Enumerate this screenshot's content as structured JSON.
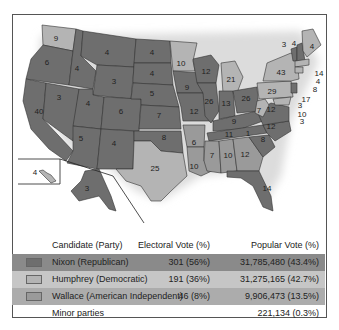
{
  "colors": {
    "republican": "#6e6e6e",
    "democratic": "#b4b4b4",
    "american_independent": "#9a9a9a",
    "border": "#333333",
    "water": "#ffffff"
  },
  "map": {
    "states": [
      {
        "abbr": "WA",
        "ev": "9",
        "party": "democratic"
      },
      {
        "abbr": "OR",
        "ev": "6",
        "party": "republican"
      },
      {
        "abbr": "CA",
        "ev": "40",
        "party": "republican"
      },
      {
        "abbr": "NV",
        "ev": "3",
        "party": "republican"
      },
      {
        "abbr": "ID",
        "ev": "4",
        "party": "republican"
      },
      {
        "abbr": "MT",
        "ev": "4",
        "party": "republican"
      },
      {
        "abbr": "WY",
        "ev": "3",
        "party": "republican"
      },
      {
        "abbr": "UT",
        "ev": "4",
        "party": "republican"
      },
      {
        "abbr": "CO",
        "ev": "6",
        "party": "republican"
      },
      {
        "abbr": "AZ",
        "ev": "5",
        "party": "republican"
      },
      {
        "abbr": "NM",
        "ev": "4",
        "party": "republican"
      },
      {
        "abbr": "ND",
        "ev": "4",
        "party": "republican"
      },
      {
        "abbr": "SD",
        "ev": "4",
        "party": "republican"
      },
      {
        "abbr": "NE",
        "ev": "5",
        "party": "republican"
      },
      {
        "abbr": "KS",
        "ev": "7",
        "party": "republican"
      },
      {
        "abbr": "OK",
        "ev": "8",
        "party": "republican"
      },
      {
        "abbr": "TX",
        "ev": "25",
        "party": "democratic"
      },
      {
        "abbr": "MN",
        "ev": "10",
        "party": "democratic"
      },
      {
        "abbr": "IA",
        "ev": "9",
        "party": "republican"
      },
      {
        "abbr": "MO",
        "ev": "12",
        "party": "republican"
      },
      {
        "abbr": "AR",
        "ev": "6",
        "party": "american_independent"
      },
      {
        "abbr": "LA",
        "ev": "10",
        "party": "american_independent"
      },
      {
        "abbr": "WI",
        "ev": "12",
        "party": "republican"
      },
      {
        "abbr": "IL",
        "ev": "26",
        "party": "republican"
      },
      {
        "abbr": "MI",
        "ev": "21",
        "party": "democratic"
      },
      {
        "abbr": "IN",
        "ev": "13",
        "party": "republican"
      },
      {
        "abbr": "OH",
        "ev": "26",
        "party": "republican"
      },
      {
        "abbr": "KY",
        "ev": "9",
        "party": "republican"
      },
      {
        "abbr": "TN",
        "ev": "11",
        "party": "republican"
      },
      {
        "abbr": "MS",
        "ev": "7",
        "party": "american_independent"
      },
      {
        "abbr": "AL",
        "ev": "10",
        "party": "american_independent"
      },
      {
        "abbr": "GA",
        "ev": "12",
        "party": "american_independent"
      },
      {
        "abbr": "FL",
        "ev": "14",
        "party": "republican"
      },
      {
        "abbr": "SC",
        "ev": "8",
        "party": "republican"
      },
      {
        "abbr": "NC",
        "ev": "12",
        "party": "republican"
      },
      {
        "abbr": "VA",
        "ev": "12",
        "party": "republican"
      },
      {
        "abbr": "WV",
        "ev": "7",
        "party": "democratic"
      },
      {
        "abbr": "PA",
        "ev": "29",
        "party": "democratic"
      },
      {
        "abbr": "NY",
        "ev": "43",
        "party": "democratic"
      },
      {
        "abbr": "VT",
        "ev": "3",
        "party": "republican"
      },
      {
        "abbr": "NH",
        "ev": "4",
        "party": "republican"
      },
      {
        "abbr": "ME",
        "ev": "4",
        "party": "democratic"
      },
      {
        "abbr": "MA",
        "ev": "14",
        "party": "democratic"
      },
      {
        "abbr": "RI",
        "ev": "4",
        "party": "democratic"
      },
      {
        "abbr": "CT",
        "ev": "8",
        "party": "democratic"
      },
      {
        "abbr": "NJ",
        "ev": "17",
        "party": "republican"
      },
      {
        "abbr": "DE",
        "ev": "3",
        "party": "republican"
      },
      {
        "abbr": "MD",
        "ev": "10",
        "party": "democratic"
      },
      {
        "abbr": "DC",
        "ev": "3",
        "party": "democratic"
      },
      {
        "abbr": "AK",
        "ev": "3",
        "party": "republican"
      },
      {
        "abbr": "HI",
        "ev": "4",
        "party": "democratic"
      },
      {
        "abbr": "NC-faithless",
        "ev": "1",
        "party": "american_independent"
      }
    ]
  },
  "table": {
    "headers": {
      "candidate": "Candidate (Party)",
      "electoral": "Electoral Vote (%)",
      "popular": "Popular Vote (%)"
    },
    "rows": [
      {
        "candidate": "Nixon (Republican)",
        "electoral": "301 (56%)",
        "popular": "31,785,480 (43.4%)",
        "swatch": "#6e6e6e",
        "bg": "#8a8a8a"
      },
      {
        "candidate": "Humphrey (Democratic)",
        "electoral": "191 (36%)",
        "popular": "31,275,165 (42.7%)",
        "swatch": "#b4b4b4",
        "bg": "#c6c6c6"
      },
      {
        "candidate": "Wallace (American Independent)",
        "electoral": "46 (8%)",
        "popular": "9,906,473 (13.5%)",
        "swatch": "#9a9a9a",
        "bg": "#acacac"
      }
    ],
    "minor": {
      "candidate": "Minor parties",
      "popular": "221,134 (0.3%)"
    }
  }
}
